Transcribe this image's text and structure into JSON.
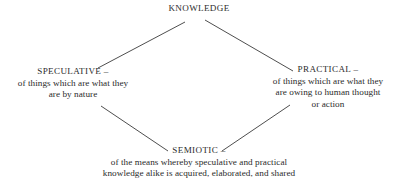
{
  "diagram": {
    "title": "KNOWLEDGE",
    "background_color": "#ffffff",
    "text_color": "#2b2b2b",
    "line_color": "#3a3a3a",
    "nodes": {
      "top": {
        "label": "KNOWLEDGE",
        "description_lines": []
      },
      "left": {
        "label": "SPECULATIVE –",
        "description_lines": [
          "of things which are what they",
          "are by nature"
        ]
      },
      "right": {
        "label": "PRACTICAL –",
        "description_lines": [
          "of things which are what they",
          "are owing to human thought",
          "or action"
        ]
      },
      "bottom": {
        "label": "SEMIOTIC –",
        "description_lines": [
          "of the means whereby speculative and practical",
          "knowledge alike is acquired, elaborated, and shared"
        ]
      }
    },
    "edges": [
      {
        "name": "knowledge-to-speculative",
        "x1": 98,
        "y1": 68,
        "x2": 185,
        "y2": 22
      },
      {
        "name": "knowledge-to-practical",
        "x1": 205,
        "y1": 20,
        "x2": 293,
        "y2": 71
      },
      {
        "name": "speculative-to-semiotic",
        "x1": 101,
        "y1": 106,
        "x2": 168,
        "y2": 151
      },
      {
        "name": "practical-to-semiotic",
        "x1": 222,
        "y1": 151,
        "x2": 290,
        "y2": 105
      }
    ]
  }
}
